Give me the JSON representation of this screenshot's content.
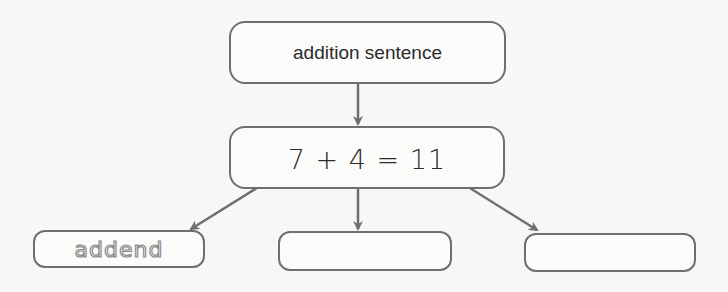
{
  "diagram": {
    "title_node": {
      "label": "addition sentence"
    },
    "equation_node": {
      "label": "7 + 4 = 11",
      "parts": [
        "7",
        "+",
        "4",
        "=",
        "11"
      ]
    },
    "answer_nodes": [
      {
        "label": "addend",
        "style": "traced"
      },
      {
        "label": ""
      },
      {
        "label": ""
      }
    ],
    "edges": [
      {
        "from": "title_node",
        "to": "equation_node"
      },
      {
        "from": "equation_node.7",
        "to": "answer_nodes.0"
      },
      {
        "from": "equation_node.4",
        "to": "answer_nodes.1"
      },
      {
        "from": "equation_node.11",
        "to": "answer_nodes.2"
      }
    ],
    "colors": {
      "stroke": "#6f6f6f",
      "text": "#2b2b2b",
      "traced_text": "#8a8a8a",
      "background": "#f7f7f6"
    }
  }
}
